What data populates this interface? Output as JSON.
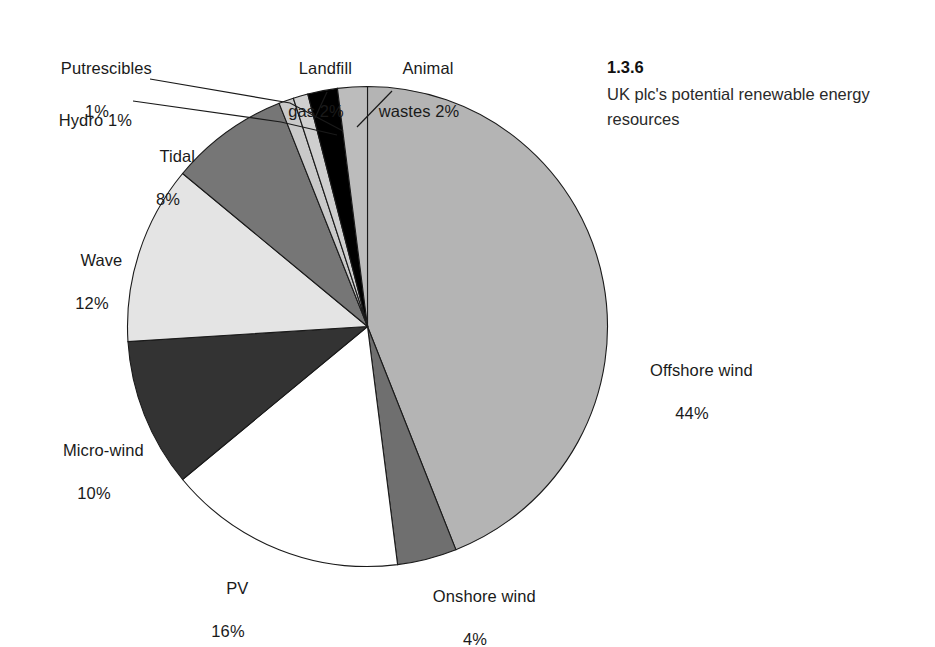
{
  "caption": {
    "number": "1.3.6",
    "text": "UK plc's potential renewable energy resources"
  },
  "chart_data": {
    "type": "pie",
    "title": "UK plc's potential renewable energy resources",
    "unit": "%",
    "total": 100,
    "start_angle_deg": 0,
    "direction": "clockwise",
    "labels_show_percent": true,
    "legend": "none (direct labels with leader lines)",
    "categories": [
      "Offshore wind",
      "Onshore wind",
      "PV",
      "Micro-wind",
      "Wave",
      "Tidal",
      "Hydro",
      "Putrescibles",
      "Landfill gas",
      "Animal wastes"
    ],
    "values": [
      44,
      4,
      16,
      10,
      12,
      8,
      1,
      1,
      2,
      2
    ],
    "colors": [
      "#b4b4b4",
      "#6f6f6f",
      "#ffffff",
      "#333333",
      "#e4e4e4",
      "#767676",
      "#c9c9c9",
      "#cfcfcf",
      "#000000",
      "#bcbcbc"
    ],
    "slices": [
      {
        "label": "Offshore wind",
        "value": 44,
        "text": "Offshore wind",
        "percent_text": "44%",
        "color": "#b4b4b4"
      },
      {
        "label": "Onshore wind",
        "value": 4,
        "text": "Onshore wind",
        "percent_text": "4%",
        "color": "#6f6f6f"
      },
      {
        "label": "PV",
        "value": 16,
        "text": "PV",
        "percent_text": "16%",
        "color": "#ffffff"
      },
      {
        "label": "Micro-wind",
        "value": 10,
        "text": "Micro-wind",
        "percent_text": "10%",
        "color": "#333333"
      },
      {
        "label": "Wave",
        "value": 12,
        "text": "Wave",
        "percent_text": "12%",
        "color": "#e4e4e4"
      },
      {
        "label": "Tidal",
        "value": 8,
        "text": "Tidal",
        "percent_text": "8%",
        "color": "#767676"
      },
      {
        "label": "Hydro",
        "value": 1,
        "text": "Hydro 1%",
        "percent_text": "1%",
        "color": "#c9c9c9"
      },
      {
        "label": "Putrescibles",
        "value": 1,
        "text": "Putrescibles",
        "percent_text": "1%",
        "color": "#cfcfcf"
      },
      {
        "label": "Landfill gas",
        "value": 2,
        "text": "Landfill\ngas 2%",
        "percent_text": "2%",
        "color": "#000000"
      },
      {
        "label": "Animal wastes",
        "value": 2,
        "text": "Animal\nwastes 2%",
        "percent_text": "2%",
        "color": "#bcbcbc"
      }
    ]
  },
  "labels": {
    "putrescibles_name": "Putrescibles",
    "putrescibles_pct": "1%",
    "hydro": "Hydro 1%",
    "tidal_name": "Tidal",
    "tidal_pct": "8%",
    "wave_name": "Wave",
    "wave_pct": "12%",
    "microwind_name": "Micro-wind",
    "microwind_pct": "10%",
    "pv_name": "PV",
    "pv_pct": "16%",
    "onshore_name": "Onshore wind",
    "onshore_pct": "4%",
    "offshore_name": "Offshore wind",
    "offshore_pct": "44%",
    "landfill_line1": "Landfill",
    "landfill_line2": "gas 2%",
    "animal_line1": "Animal",
    "animal_line2": "wastes 2%"
  }
}
